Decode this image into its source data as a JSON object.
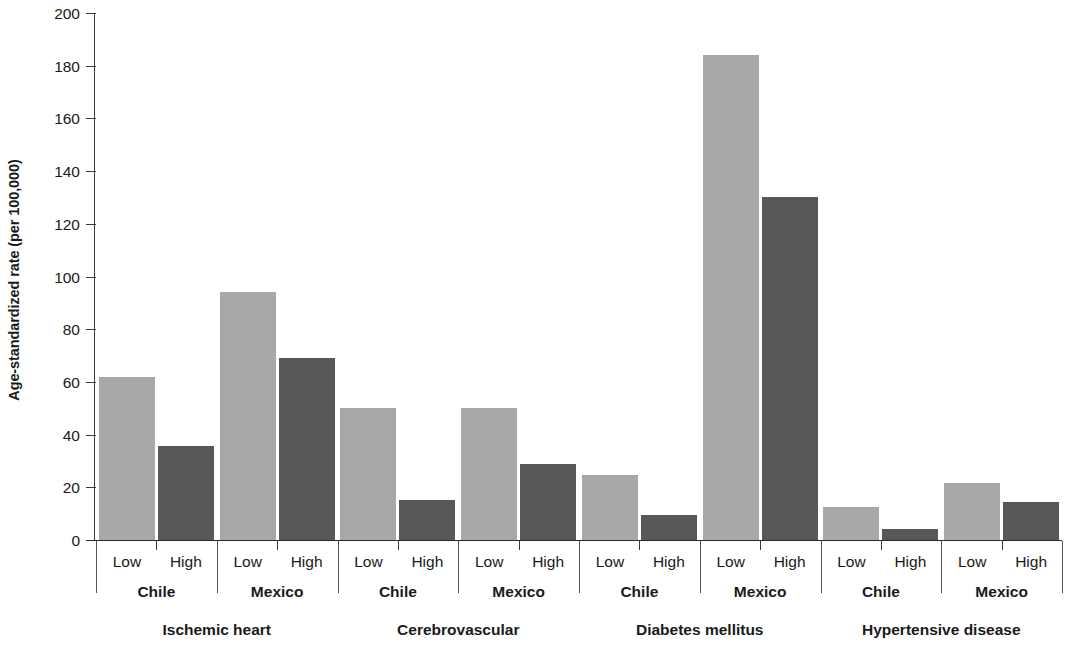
{
  "chart_data": {
    "type": "bar",
    "title": "",
    "xlabel": "",
    "ylabel": "Age-standardized rate (per 100,000)",
    "ylim": [
      0,
      200
    ],
    "ytick_values": [
      0,
      20,
      40,
      60,
      80,
      100,
      120,
      140,
      160,
      180,
      200
    ],
    "ytick_labels": [
      "0",
      "20",
      "40",
      "60",
      "80",
      "100",
      "120",
      "140",
      "160",
      "180",
      "200"
    ],
    "grid": false,
    "legend_position": "none",
    "series": [
      {
        "name": "Low",
        "color": "#a8a8a8",
        "values": [
          62,
          94,
          50,
          50,
          24.5,
          184,
          12.5,
          21.5
        ]
      },
      {
        "name": "High",
        "color": "#585858",
        "values": [
          35.5,
          69,
          15,
          29,
          9.5,
          130,
          4,
          14.5
        ]
      }
    ],
    "categories": [
      "Ischemic heart – Chile",
      "Ischemic heart – Mexico",
      "Cerebrovascular – Chile",
      "Cerebrovascular – Mexico",
      "Diabetes mellitus – Chile",
      "Diabetes mellitus – Mexico",
      "Hypertensive disease – Chile",
      "Hypertensive disease – Mexico"
    ],
    "bars": [
      {
        "group": "Ischemic heart",
        "country": "Chile",
        "level": "Low",
        "value": 62,
        "color": "#a8a8a8"
      },
      {
        "group": "Ischemic heart",
        "country": "Chile",
        "level": "High",
        "value": 35.5,
        "color": "#585858"
      },
      {
        "group": "Ischemic heart",
        "country": "Mexico",
        "level": "Low",
        "value": 94,
        "color": "#a8a8a8"
      },
      {
        "group": "Ischemic heart",
        "country": "Mexico",
        "level": "High",
        "value": 69,
        "color": "#585858"
      },
      {
        "group": "Cerebrovascular",
        "country": "Chile",
        "level": "Low",
        "value": 50,
        "color": "#a8a8a8"
      },
      {
        "group": "Cerebrovascular",
        "country": "Chile",
        "level": "High",
        "value": 15,
        "color": "#585858"
      },
      {
        "group": "Cerebrovascular",
        "country": "Mexico",
        "level": "Low",
        "value": 50,
        "color": "#a8a8a8"
      },
      {
        "group": "Cerebrovascular",
        "country": "Mexico",
        "level": "High",
        "value": 29,
        "color": "#585858"
      },
      {
        "group": "Diabetes mellitus",
        "country": "Chile",
        "level": "Low",
        "value": 24.5,
        "color": "#a8a8a8"
      },
      {
        "group": "Diabetes mellitus",
        "country": "Chile",
        "level": "High",
        "value": 9.5,
        "color": "#585858"
      },
      {
        "group": "Diabetes mellitus",
        "country": "Mexico",
        "level": "Low",
        "value": 184,
        "color": "#a8a8a8"
      },
      {
        "group": "Diabetes mellitus",
        "country": "Mexico",
        "level": "High",
        "value": 130,
        "color": "#585858"
      },
      {
        "group": "Hypertensive disease",
        "country": "Chile",
        "level": "Low",
        "value": 12.5,
        "color": "#a8a8a8"
      },
      {
        "group": "Hypertensive disease",
        "country": "Chile",
        "level": "High",
        "value": 4,
        "color": "#585858"
      },
      {
        "group": "Hypertensive disease",
        "country": "Mexico",
        "level": "Low",
        "value": 21.5,
        "color": "#a8a8a8"
      },
      {
        "group": "Hypertensive disease",
        "country": "Mexico",
        "level": "High",
        "value": 14.5,
        "color": "#585858"
      }
    ],
    "level_labels": [
      "Low",
      "High",
      "Low",
      "High",
      "Low",
      "High",
      "Low",
      "High",
      "Low",
      "High",
      "Low",
      "High",
      "Low",
      "High",
      "Low",
      "High"
    ],
    "country_labels": [
      "Chile",
      "Mexico",
      "Chile",
      "Mexico",
      "Chile",
      "Mexico",
      "Chile",
      "Mexico"
    ],
    "group_labels": [
      "Ischemic heart",
      "Cerebrovascular",
      "Diabetes mellitus",
      "Hypertensive disease"
    ]
  },
  "axis": {
    "y_title": "Age-standardized rate (per 100,000)"
  }
}
